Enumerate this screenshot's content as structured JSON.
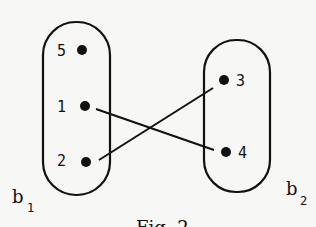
{
  "diagram": {
    "caption": "Fig. 2",
    "sets": [
      {
        "name": "b",
        "subscript": "1",
        "elements": [
          "5",
          "1",
          "2"
        ]
      },
      {
        "name": "b",
        "subscript": "2",
        "elements": [
          "3",
          "4"
        ]
      }
    ],
    "edges": [
      {
        "from": "1",
        "to": "4"
      },
      {
        "from": "2",
        "to": "3"
      }
    ],
    "colors": {
      "ink": "#111111",
      "background": "#f7f7f5"
    }
  }
}
